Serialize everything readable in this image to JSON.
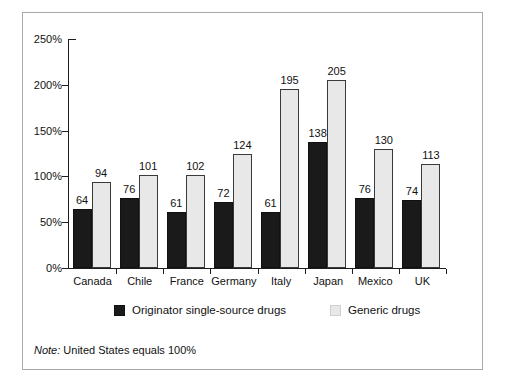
{
  "chart_data": {
    "type": "bar",
    "title": "",
    "subtitle": "",
    "xlabel": "",
    "ylabel": "",
    "ylim": [
      0,
      250
    ],
    "ytick_values": [
      0,
      50,
      100,
      150,
      200,
      250
    ],
    "ytick_labels": [
      "0%",
      "50%",
      "100%",
      "150%",
      "200%",
      "250%"
    ],
    "grid": false,
    "legend_position": "bottom",
    "value_labels": true,
    "categories": [
      "Canada",
      "Chile",
      "France",
      "Germany",
      "Italy",
      "Japan",
      "Mexico",
      "UK"
    ],
    "series": [
      {
        "name": "Originator single-source drugs",
        "color": "#1a1a1a",
        "values": [
          64,
          76,
          61,
          72,
          61,
          138,
          76,
          74
        ]
      },
      {
        "name": "Generic drugs",
        "color": "#e8e8e8",
        "values": [
          94,
          101,
          102,
          124,
          195,
          205,
          130,
          113
        ]
      }
    ],
    "annotations": [
      "Note: United States equals 100%"
    ]
  },
  "legend": {
    "items": [
      {
        "label": "Originator single-source drugs",
        "swatch": "dark"
      },
      {
        "label": "Generic drugs",
        "swatch": "light"
      }
    ]
  },
  "note": {
    "prefix": "Note:",
    "text": "United States equals 100%"
  }
}
